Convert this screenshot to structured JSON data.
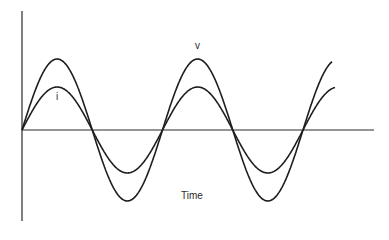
{
  "figure": {
    "type": "waveform diagram",
    "labels": {
      "voltage": "v",
      "current": "i",
      "x_axis": "Time"
    },
    "colors": {
      "curve": "#1e1e1e",
      "axis": "#2a2a2a",
      "background": "#ffffff"
    },
    "geometry": {
      "origin_x": 22,
      "axis_y": 130,
      "axis_end_x": 374,
      "y_axis_top": 11,
      "y_axis_bottom": 221,
      "period_px": 140.5,
      "voltage_amplitude_px": 71,
      "current_amplitude_px": 43,
      "voltage_end_x": 332,
      "current_end_x": 335
    }
  }
}
